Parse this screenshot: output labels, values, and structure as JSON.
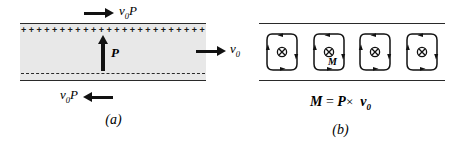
{
  "figure": {
    "panel_a": {
      "caption": "(a)",
      "top_flux_label": "v",
      "top_flux_sub": "0",
      "top_flux_tail": "P",
      "top_arrow_icon": "arrow-right-icon",
      "bottom_flux_label": "v",
      "bottom_flux_sub": "0",
      "bottom_flux_tail": "P",
      "bottom_arrow_icon": "arrow-left-icon",
      "polarization_label": "P",
      "polarization_arrow_icon": "arrow-up-icon",
      "surface_charge_plus": "+",
      "plus_count": 24,
      "bound_charge_bottom": "dashed-negative-surface",
      "slab_fill_color": "#e8e8e8",
      "border_color": "#2a2a2a"
    },
    "middle": {
      "velocity_label": "v",
      "velocity_sub": "0",
      "arrow_icon": "arrow-right-icon"
    },
    "panel_b": {
      "caption": "(b)",
      "loop_count": 4,
      "loop_center_icon": "circle-cross-icon",
      "loop_circulation": "clockwise",
      "magnetization_label": "M",
      "formula": {
        "lhs": "M",
        "equals": "=",
        "rhs_first": "P",
        "cross": "×",
        "rhs_second": "v",
        "rhs_second_sub": "0"
      },
      "border_color": "#2a2a2a"
    }
  }
}
